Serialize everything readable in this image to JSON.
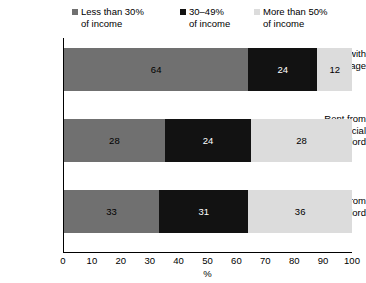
{
  "legend": {
    "items": [
      {
        "label": "Less than 30%\nof income",
        "color": "#707070",
        "swatch_icon": "square-marker-icon"
      },
      {
        "label": "30–49%\nof income",
        "color": "#121212",
        "swatch_icon": "square-marker-icon"
      },
      {
        "label": "More than 50%\nof income",
        "color": "#dcdcdc",
        "swatch_icon": "square-marker-icon"
      }
    ]
  },
  "axis": {
    "x_title": "%",
    "x_ticks": [
      "0",
      "10",
      "20",
      "30",
      "40",
      "50",
      "60",
      "70",
      "80",
      "90",
      "100"
    ],
    "categories": [
      "Own with\nmortgage",
      "Rent from\nsocial\nlandlord",
      "Rent from\nlandlord"
    ]
  },
  "chart_data": {
    "type": "bar",
    "orientation": "horizontal",
    "stacked": true,
    "title": "",
    "subtitle": "",
    "xlabel": "%",
    "ylabel": "",
    "xlim": [
      0,
      100
    ],
    "xticks": [
      0,
      10,
      20,
      30,
      40,
      50,
      60,
      70,
      80,
      90,
      100
    ],
    "grid": false,
    "legend_position": "top",
    "categories": [
      "Own with mortgage",
      "Rent from social landlord",
      "Rent from landlord"
    ],
    "series": [
      {
        "name": "Less than 30% of income",
        "color": "#707070",
        "values": [
          64,
          28,
          33
        ]
      },
      {
        "name": "30–49% of income",
        "color": "#121212",
        "values": [
          24,
          24,
          31
        ]
      },
      {
        "name": "More than 50% of income",
        "color": "#dcdcdc",
        "values": [
          12,
          28,
          36
        ]
      }
    ],
    "data_labels": [
      [
        "64",
        "24",
        "12"
      ],
      [
        "28",
        "24",
        "28"
      ],
      [
        "33",
        "31",
        "36"
      ]
    ],
    "label_text_colors": [
      [
        "#000000",
        "#ffffff",
        "#000000"
      ],
      [
        "#000000",
        "#ffffff",
        "#000000"
      ],
      [
        "#000000",
        "#ffffff",
        "#000000"
      ]
    ]
  }
}
